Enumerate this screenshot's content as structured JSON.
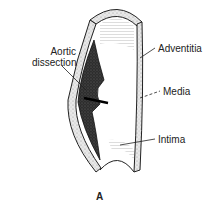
{
  "figure": {
    "panel_label": "A",
    "labels": {
      "aortic_dissection_line1": "Aortic",
      "aortic_dissection_line2": "dissection",
      "adventitia": "Adventitia",
      "media": "Media",
      "intima": "Intima"
    },
    "colors": {
      "outline": "#222222",
      "wall_fill": "#e4e4e4",
      "dissection_fill": "#2a2a2a",
      "background": "#ffffff"
    }
  }
}
